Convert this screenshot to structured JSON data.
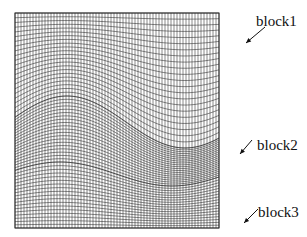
{
  "figure": {
    "type": "structured mesh, three blocks",
    "grid_box": {
      "x0": 15,
      "y0": 13,
      "x1": 219,
      "y1": 228
    },
    "colors": {
      "line": "#2a2a2a",
      "background": "#ffffff"
    },
    "blocks": [
      {
        "id": "block1",
        "label": "block1",
        "region": "top",
        "rows": 22,
        "cols": 68
      },
      {
        "id": "block2",
        "label": "block2",
        "region": "wavy-middle-band",
        "rows": 20,
        "cols": 68
      },
      {
        "id": "block3",
        "label": "block3",
        "region": "bottom",
        "rows": 18,
        "cols": 68
      }
    ],
    "interfaces": {
      "upper": {
        "left_y": 112,
        "peak_x": 67,
        "peak_y": 96,
        "trough_x": 185,
        "trough_y": 148,
        "right_y": 122
      },
      "lower": {
        "left_y": 172,
        "peak_x": 60,
        "peak_y": 162,
        "trough_x": 172,
        "trough_y": 186,
        "right_y": 168
      }
    }
  },
  "annotations": [
    {
      "text": "block1",
      "x": 256,
      "y": 14,
      "arrow": {
        "x1": 265,
        "y1": 27,
        "x2": 246,
        "y2": 43
      }
    },
    {
      "text": "block2",
      "x": 257,
      "y": 138,
      "arrow": {
        "x1": 252,
        "y1": 140,
        "x2": 240,
        "y2": 154
      }
    },
    {
      "text": "block3",
      "x": 258,
      "y": 205,
      "arrow": {
        "x1": 258,
        "y1": 209,
        "x2": 244,
        "y2": 223
      }
    }
  ]
}
